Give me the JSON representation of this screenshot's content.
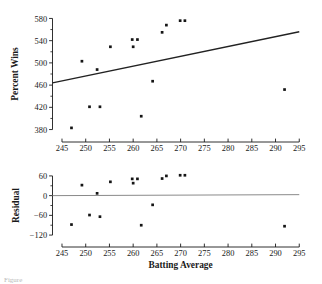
{
  "figure": {
    "background": "#ffffff",
    "ink": "#1a1a1a",
    "point_color": "#151515",
    "line_color": "#222222",
    "zero_line_color": "#8a8a8a"
  },
  "chart_data": [
    {
      "type": "scatter",
      "panel": "top",
      "title": "",
      "xlabel": "",
      "ylabel": "Percent Wins",
      "xlim": [
        243,
        296
      ],
      "ylim": [
        372,
        588
      ],
      "xticks": [
        245,
        250,
        255,
        260,
        265,
        270,
        275,
        280,
        285,
        290,
        295
      ],
      "yticks": [
        380,
        420,
        460,
        500,
        540,
        580
      ],
      "xtick_labels": [
        "245",
        "250",
        "255",
        "260",
        "265",
        "270",
        "275",
        "280",
        "285",
        "290",
        "295"
      ],
      "ytick_labels": [
        "380",
        "420",
        "460",
        "500",
        "540",
        "580"
      ],
      "minor_yticks": [
        400,
        440,
        480,
        520,
        560
      ],
      "grid": false,
      "legend": false,
      "points": [
        {
          "x": 247.0,
          "y": 383
        },
        {
          "x": 249.2,
          "y": 503
        },
        {
          "x": 250.8,
          "y": 421
        },
        {
          "x": 252.4,
          "y": 488
        },
        {
          "x": 253.0,
          "y": 421
        },
        {
          "x": 255.2,
          "y": 529
        },
        {
          "x": 259.8,
          "y": 542
        },
        {
          "x": 260.0,
          "y": 529
        },
        {
          "x": 260.9,
          "y": 542
        },
        {
          "x": 261.7,
          "y": 404
        },
        {
          "x": 264.1,
          "y": 467
        },
        {
          "x": 266.1,
          "y": 555
        },
        {
          "x": 267.0,
          "y": 568
        },
        {
          "x": 269.9,
          "y": 576
        },
        {
          "x": 270.9,
          "y": 576
        },
        {
          "x": 291.9,
          "y": 452
        }
      ],
      "fit_line": {
        "label": "regression line",
        "x1": 243.0,
        "y1": 464,
        "x2": 295.0,
        "y2": 556
      }
    },
    {
      "type": "scatter",
      "panel": "bottom",
      "title": "",
      "xlabel": "Batting Average",
      "ylabel": "Residual",
      "xlim": [
        243,
        296
      ],
      "ylim": [
        -138,
        78
      ],
      "xticks": [
        245,
        250,
        255,
        260,
        265,
        270,
        275,
        280,
        285,
        290,
        295
      ],
      "yticks": [
        -120,
        -60,
        0,
        60
      ],
      "xtick_labels": [
        "245",
        "250",
        "255",
        "260",
        "265",
        "270",
        "275",
        "280",
        "285",
        "290",
        "295"
      ],
      "ytick_labels": [
        "−120",
        "−60",
        "0",
        "60"
      ],
      "minor_yticks": [
        -90,
        -30,
        30
      ],
      "grid": false,
      "legend": false,
      "points": [
        {
          "x": 247.0,
          "y": -88
        },
        {
          "x": 249.2,
          "y": 32
        },
        {
          "x": 250.8,
          "y": -59
        },
        {
          "x": 252.4,
          "y": 7
        },
        {
          "x": 253.0,
          "y": -64
        },
        {
          "x": 255.2,
          "y": 42
        },
        {
          "x": 259.8,
          "y": 51
        },
        {
          "x": 260.0,
          "y": 38
        },
        {
          "x": 260.9,
          "y": 51
        },
        {
          "x": 261.7,
          "y": -90
        },
        {
          "x": 264.1,
          "y": -28
        },
        {
          "x": 266.1,
          "y": 52
        },
        {
          "x": 267.0,
          "y": 60
        },
        {
          "x": 269.9,
          "y": 62
        },
        {
          "x": 270.9,
          "y": 62
        },
        {
          "x": 291.9,
          "y": -93
        }
      ],
      "zero_line": {
        "label": "zero residual line",
        "x1": 243.0,
        "y1": 0,
        "x2": 295.0,
        "y2": 3
      }
    }
  ],
  "caption": {
    "text": "Figure"
  }
}
